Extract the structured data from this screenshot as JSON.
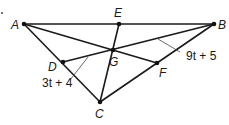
{
  "figure": {
    "type": "triangle-medians",
    "points": {
      "A": {
        "label": "A",
        "x": 24,
        "y": 24
      },
      "E": {
        "label": "E",
        "x": 119,
        "y": 24
      },
      "B": {
        "label": "B",
        "x": 214,
        "y": 24
      },
      "G": {
        "label": "G",
        "x": 113,
        "y": 50
      },
      "D": {
        "label": "D",
        "x": 63,
        "y": 62
      },
      "F": {
        "label": "F",
        "x": 157,
        "y": 63
      },
      "C": {
        "label": "C",
        "x": 100,
        "y": 102
      }
    },
    "segments": [
      [
        "A",
        "B"
      ],
      [
        "A",
        "C"
      ],
      [
        "B",
        "C"
      ],
      [
        "A",
        "F"
      ],
      [
        "B",
        "D"
      ],
      [
        "C",
        "E"
      ]
    ],
    "annotations": {
      "bg_length": "9t + 5",
      "dg_length": "3t + 4"
    },
    "stray_mark": "."
  }
}
